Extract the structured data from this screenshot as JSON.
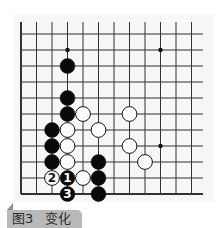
{
  "caption": {
    "figure_label": "图3",
    "title": "变化"
  },
  "board": {
    "columns": 12,
    "rows": 11,
    "origin_x": 21,
    "origin_y": 34,
    "col_spacing": 15.5,
    "row_spacing": 16,
    "top_extend_y": 22,
    "right_extend_x": 203,
    "edges": [
      "left",
      "bottom"
    ],
    "line_color": "#333333",
    "stone_radius": 7.4,
    "star_points": [
      [
        3,
        1
      ],
      [
        9,
        1
      ],
      [
        9,
        7
      ]
    ],
    "stones": [
      {
        "col": 3,
        "row": 2,
        "color": "black"
      },
      {
        "col": 3,
        "row": 4,
        "color": "black"
      },
      {
        "col": 3,
        "row": 5,
        "color": "black"
      },
      {
        "col": 2,
        "row": 6,
        "color": "black"
      },
      {
        "col": 2,
        "row": 7,
        "color": "black"
      },
      {
        "col": 2,
        "row": 8,
        "color": "black"
      },
      {
        "col": 5,
        "row": 8,
        "color": "black"
      },
      {
        "col": 5,
        "row": 9,
        "color": "black"
      },
      {
        "col": 5,
        "row": 10,
        "color": "black"
      },
      {
        "col": 3,
        "row": 9,
        "color": "black",
        "label": "1"
      },
      {
        "col": 3,
        "row": 10,
        "color": "black",
        "label": "3"
      },
      {
        "col": 4,
        "row": 5,
        "color": "white"
      },
      {
        "col": 3,
        "row": 6,
        "color": "white"
      },
      {
        "col": 5,
        "row": 6,
        "color": "white"
      },
      {
        "col": 7,
        "row": 5,
        "color": "white"
      },
      {
        "col": 3,
        "row": 7,
        "color": "white"
      },
      {
        "col": 7,
        "row": 7,
        "color": "white"
      },
      {
        "col": 3,
        "row": 8,
        "color": "white"
      },
      {
        "col": 8,
        "row": 8,
        "color": "white"
      },
      {
        "col": 4,
        "row": 9,
        "color": "white"
      },
      {
        "col": 2,
        "row": 9,
        "color": "white",
        "label": "2"
      }
    ]
  }
}
